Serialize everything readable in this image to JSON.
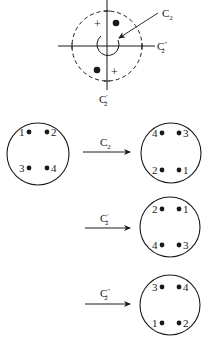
{
  "figure": {
    "symmetry_diagram": {
      "axis_labels": {
        "principal": {
          "base": "C",
          "sub": "2",
          "prime": ""
        },
        "vertical_axis": {
          "base": "C",
          "sub": "2",
          "prime": "′"
        },
        "horizontal_axis": {
          "base": "C",
          "sub": "2",
          "prime": "″"
        }
      },
      "markers": {
        "upper_left": "+",
        "lower_right": "+"
      }
    },
    "original": {
      "positions": {
        "top_left": "1",
        "top_right": "2",
        "bottom_left": "3",
        "bottom_right": "4"
      }
    },
    "operations": [
      {
        "label": {
          "base": "C",
          "sub": "2",
          "prime": ""
        },
        "result": {
          "top_left": "4",
          "top_right": "3",
          "bottom_left": "2",
          "bottom_right": "1"
        }
      },
      {
        "label": {
          "base": "C",
          "sub": "2",
          "prime": "′"
        },
        "result": {
          "top_left": "2",
          "top_right": "1",
          "bottom_left": "4",
          "bottom_right": "3"
        }
      },
      {
        "label": {
          "base": "C",
          "sub": "2",
          "prime": "″"
        },
        "result": {
          "top_left": "3",
          "top_right": "4",
          "bottom_left": "1",
          "bottom_right": "2"
        }
      }
    ],
    "colors": {
      "ink": "#1a1a1a",
      "background": "#ffffff"
    }
  }
}
